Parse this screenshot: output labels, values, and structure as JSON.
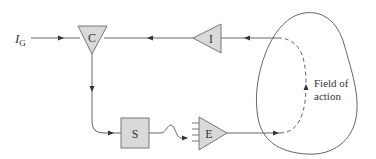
{
  "diagram": {
    "type": "feedback-control-loop",
    "input": {
      "label_main": "I",
      "label_sub": "G"
    },
    "nodes": [
      {
        "id": "C",
        "label": "C",
        "shape": "triangle-down"
      },
      {
        "id": "I",
        "label": "I",
        "shape": "triangle-left"
      },
      {
        "id": "S",
        "label": "S",
        "shape": "square"
      },
      {
        "id": "E",
        "label": "E",
        "shape": "triangle-right"
      }
    ],
    "region": {
      "label_line1": "Field of",
      "label_line2": "action"
    },
    "edges": [
      {
        "from": "I_G",
        "to": "C",
        "style": "solid"
      },
      {
        "from": "field",
        "to": "I",
        "style": "solid"
      },
      {
        "from": "I",
        "to": "C",
        "style": "solid"
      },
      {
        "from": "C",
        "to": "S",
        "style": "solid"
      },
      {
        "from": "S",
        "to": "E",
        "style": "wavy"
      },
      {
        "from": "E",
        "to": "field",
        "style": "solid"
      },
      {
        "from": "field-entry",
        "to": "field-exit",
        "style": "dashed"
      }
    ],
    "colors": {
      "line": "#555555",
      "node_fill": "#d9d9d9",
      "node_stroke": "#777777",
      "text": "#333333"
    }
  }
}
